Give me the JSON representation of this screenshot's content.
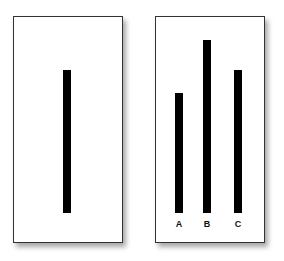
{
  "reference_card": {
    "line": {
      "label": "",
      "top": 70,
      "bottom": 213,
      "x": 63
    }
  },
  "comparison_card": {
    "lines": [
      {
        "label": "A",
        "top": 93,
        "bottom": 213,
        "x": 175
      },
      {
        "label": "B",
        "top": 40,
        "bottom": 213,
        "x": 203
      },
      {
        "label": "C",
        "top": 70,
        "bottom": 213,
        "x": 234
      }
    ]
  },
  "colors": {
    "line": "#000000",
    "border": "#333333",
    "background": "#ffffff"
  }
}
